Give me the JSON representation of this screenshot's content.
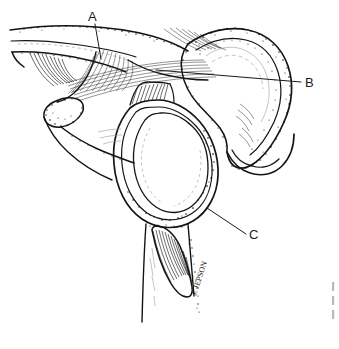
{
  "figure": {
    "kind": "anatomical-line-drawing",
    "style": "black ink line art with stipple and hatch shading on white background",
    "background_color": "#ffffff",
    "ink_color": "#141414",
    "width": 339,
    "height": 349
  },
  "labels": [
    {
      "id": "A",
      "text": "A",
      "text_x": 88,
      "text_y": 21,
      "leader": {
        "x1": 95,
        "y1": 24,
        "x2": 101,
        "y2": 59
      }
    },
    {
      "id": "B",
      "text": "B",
      "text_x": 305,
      "text_y": 87,
      "leader": {
        "x1": 301,
        "y1": 82,
        "x2": 156,
        "y2": 70
      }
    },
    {
      "id": "C",
      "text": "C",
      "text_x": 249,
      "text_y": 239,
      "leader": {
        "x1": 246,
        "y1": 234,
        "x2": 207,
        "y2": 208
      }
    }
  ],
  "signature": {
    "text": "J. JEPSON",
    "x": 196,
    "y": 296,
    "rotation_deg": -72
  },
  "margin_marks": {
    "count": 3,
    "x": 332,
    "ys": [
      286,
      300,
      314
    ],
    "color": "#b9b9b9"
  }
}
